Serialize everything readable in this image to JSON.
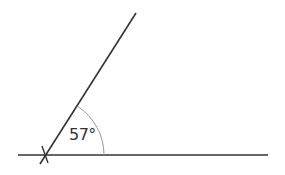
{
  "diagram": {
    "type": "angle",
    "angle_label": "57°",
    "angle_degrees": 57,
    "colors": {
      "line": "#333333",
      "arc": "#999999",
      "background": "#ffffff"
    },
    "vertex": {
      "x": 46,
      "y": 155
    },
    "baseline": {
      "x1": 18,
      "y1": 155,
      "x2": 268,
      "y2": 155
    },
    "ray": {
      "x1": 40,
      "y1": 164,
      "x2": 136,
      "y2": 13
    },
    "cross_mark": {
      "x1": 42,
      "y1": 146,
      "x2": 48,
      "y2": 163
    },
    "arc": {
      "radius": 58
    }
  }
}
